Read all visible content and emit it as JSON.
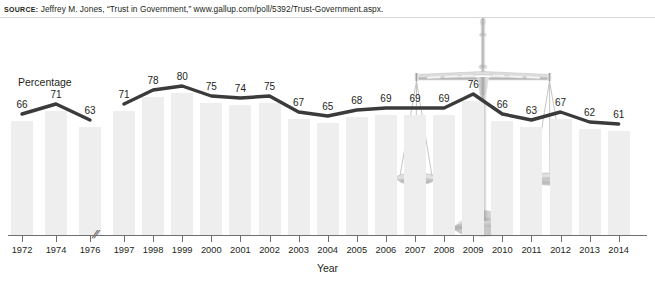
{
  "source": {
    "keyword": "SOURCE:",
    "text": " Jeffrey M. Jones, “Trust in Government,” www.gallup.com/poll/5392/Trust-Government.aspx."
  },
  "chart_data": {
    "type": "bar",
    "title": "",
    "subtitle": "",
    "xlabel": "Year",
    "ylabel": "Percentage",
    "categories": [
      "1972",
      "1974",
      "1976",
      "1997",
      "1998",
      "1999",
      "2000",
      "2001",
      "2002",
      "2003",
      "2004",
      "2005",
      "2006",
      "2007",
      "2008",
      "2009",
      "2010",
      "2011",
      "2012",
      "2013",
      "2014"
    ],
    "values": [
      66,
      71,
      63,
      71,
      78,
      80,
      75,
      74,
      75,
      67,
      65,
      68,
      69,
      69,
      69,
      76,
      66,
      63,
      67,
      62,
      61
    ],
    "ylim": [
      0,
      100
    ],
    "grid": false,
    "legend": null,
    "axis_break": {
      "after": "1976",
      "before": "1997",
      "marker": "//"
    },
    "series": [
      {
        "name": "Trust in Government",
        "values": [
          66,
          71,
          63,
          71,
          78,
          80,
          75,
          74,
          75,
          67,
          65,
          68,
          69,
          69,
          69,
          76,
          66,
          63,
          67,
          62,
          61
        ]
      }
    ],
    "annotations": [
      "balance-scale watermark graphic centered near 2009"
    ]
  },
  "colors": {
    "bar": "#eeeeee",
    "line": "#3b3b3b",
    "axis": "#6f6f6f",
    "text": "#231f20",
    "watermark": "#cfcfcf"
  },
  "graphic": {
    "name": "balance-scale-watermark"
  }
}
